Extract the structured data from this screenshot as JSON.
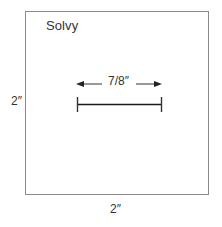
{
  "diagram": {
    "brand_label": "Solvy",
    "measure_label": "7/8″",
    "height_label": "2″",
    "width_label": "2″"
  },
  "colors": {
    "box_border": "#8a8a8a",
    "line": "#1a1a1a",
    "arrow": "#333333",
    "text": "#333333"
  }
}
